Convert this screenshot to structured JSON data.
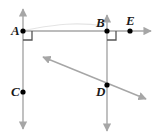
{
  "figure": {
    "background_color": "#ffffff",
    "line_color": "#a6a6a6",
    "point_color": "#000000",
    "label_color": "#1a1a1a",
    "faint_line_color": "#e0e0e0",
    "width": 163,
    "height": 137
  },
  "points": [
    {
      "name": "A",
      "label": "A",
      "x": 23,
      "y": 31,
      "label_x": 11,
      "label_y": 25
    },
    {
      "name": "B",
      "label": "B",
      "x": 107,
      "y": 31,
      "label_x": 96,
      "label_y": 17
    },
    {
      "name": "E",
      "label": "E",
      "x": 130,
      "y": 31,
      "label_x": 126,
      "label_y": 15
    },
    {
      "name": "C",
      "label": "C",
      "x": 23,
      "y": 92,
      "label_x": 11,
      "label_y": 86
    },
    {
      "name": "D",
      "label": "D",
      "x": 107,
      "y": 85,
      "label_x": 97,
      "label_y": 87
    }
  ],
  "lines": [
    {
      "name": "line-AC-vertical",
      "from": [
        23,
        8
      ],
      "to": [
        23,
        130
      ],
      "arrow_start": true,
      "arrow_end": true,
      "through": [
        "A",
        "C"
      ]
    },
    {
      "name": "line-BD-vertical",
      "from": [
        107,
        14
      ],
      "to": [
        107,
        132
      ],
      "arrow_start": true,
      "arrow_end": true,
      "through": [
        "B",
        "D"
      ]
    },
    {
      "name": "line-ABE-horizontal",
      "from": [
        23,
        31
      ],
      "to": [
        153,
        31
      ],
      "arrow_start": false,
      "arrow_end": true,
      "through": [
        "A",
        "B",
        "E"
      ]
    },
    {
      "name": "line-transversal-through-D",
      "from": [
        41,
        56
      ],
      "to": [
        148,
        100
      ],
      "arrow_start": true,
      "arrow_end": true,
      "through": [
        "D"
      ]
    }
  ],
  "right_angle_marks": [
    {
      "name": "right-angle-at-A",
      "vertex": [
        23,
        31
      ],
      "size": 9,
      "dir_x": 1,
      "dir_y": 1
    },
    {
      "name": "right-angle-at-B",
      "vertex": [
        107,
        31
      ],
      "size": 9,
      "dir_x": 1,
      "dir_y": 1
    }
  ],
  "faint_marks": [
    {
      "name": "faint-curve-A-to-B",
      "path": "M 25 30 C 50 26, 70 21, 105 26"
    }
  ]
}
